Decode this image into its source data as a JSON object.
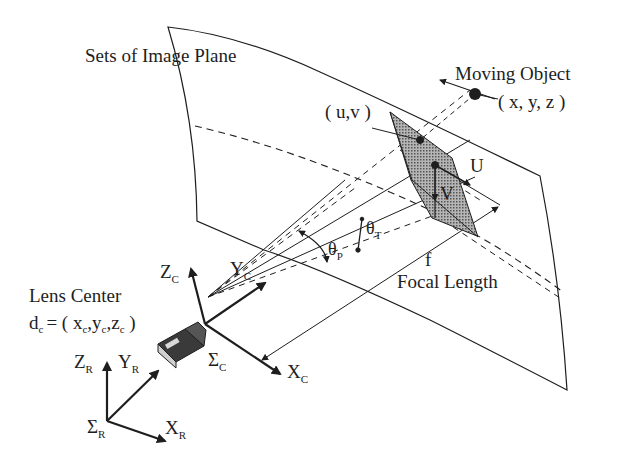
{
  "diagram": {
    "title_label": "Sets of Image Plane",
    "moving_object": {
      "label": "Moving Object",
      "coords": "( x, y, z )"
    },
    "image_point": {
      "label": "( u,v )"
    },
    "image_axes": {
      "u": "U",
      "v": "V"
    },
    "angles": {
      "tilt": {
        "base": "θ",
        "sub": "T"
      },
      "pan": {
        "base": "θ",
        "sub": "P"
      }
    },
    "focal": {
      "symbol": "f",
      "label": "Focal Length"
    },
    "lens_center": {
      "label": "Lens Center",
      "eq_prefix": "d",
      "eq_prefix_sub": "c",
      "eq_body": "= ( x",
      "x_sub": "c",
      "y": ",y",
      "y_sub": "c",
      "z": ",z",
      "z_sub": "c",
      "close": " )"
    },
    "camera_frame": {
      "x": {
        "base": "X",
        "sub": "C"
      },
      "y": {
        "base": "Y",
        "sub": "C"
      },
      "z": {
        "base": "Z",
        "sub": "C"
      },
      "origin": {
        "base": "Σ",
        "sub": "C"
      }
    },
    "robot_frame": {
      "x": {
        "base": "X",
        "sub": "R"
      },
      "y": {
        "base": "Y",
        "sub": "R"
      },
      "z": {
        "base": "Z",
        "sub": "R"
      },
      "origin": {
        "base": "Σ",
        "sub": "R"
      }
    },
    "colors": {
      "ink": "#1e1e1e",
      "patch_fill": "#8a8a8a",
      "background": "#ffffff"
    }
  }
}
